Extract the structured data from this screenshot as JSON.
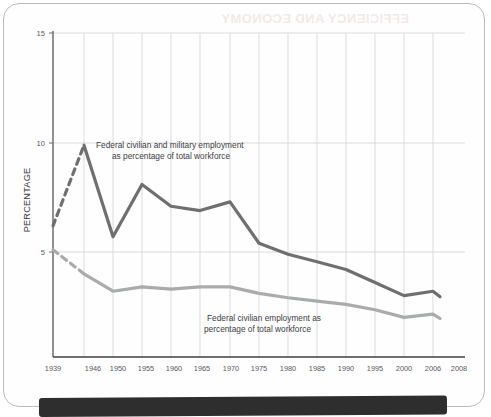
{
  "figure": {
    "background_color": "#ffffff",
    "card_border_color": "#b9bcbd",
    "caption_band_color": "#2e2e2e",
    "bleed_through_text": "EFFICIENCY AND ECONOMY"
  },
  "axes": {
    "y_axis_title": "PERCENTAGE",
    "y_tick_labels": [
      "15",
      "10",
      "5"
    ],
    "x_tick_labels": [
      "1939",
      "1946",
      "1950",
      "1955",
      "1960",
      "1965",
      "1970",
      "1975",
      "1980",
      "1985",
      "1990",
      "1995",
      "2000",
      "2006",
      "2008"
    ]
  },
  "annotations": {
    "total_series_line1": "Federal civilian and military employment",
    "total_series_line2": "as percentage of total workforce",
    "civilian_series_line1": "Federal civilian employment as",
    "civilian_series_line2": "percentage of total workforce"
  },
  "chart_data": {
    "type": "line",
    "title": "",
    "subtitle": "",
    "xlabel": "",
    "ylabel": "PERCENTAGE",
    "xlim": [
      1939,
      2008
    ],
    "ylim": [
      0,
      15
    ],
    "y_ticks": [
      5,
      10,
      15
    ],
    "grid": true,
    "grid_axis": "x",
    "legend": "annotations-inline",
    "x": [
      1939,
      1946,
      1950,
      1955,
      1960,
      1965,
      1970,
      1975,
      1980,
      1985,
      1990,
      1995,
      2000,
      2006,
      2008
    ],
    "series": [
      {
        "name": "Federal civilian and military employment as percentage of total workforce",
        "color": "#6e6f71",
        "line_width": 3.2,
        "values": [
          6.2,
          9.9,
          5.7,
          8.1,
          7.1,
          6.9,
          7.3,
          5.4,
          4.9,
          4.55,
          4.2,
          3.6,
          3.0,
          3.2,
          2.95
        ],
        "dashed_from": 1939,
        "dashed_to": 1946,
        "dash_note": "segment 1939-1946 drawn dashed (interpolated)"
      },
      {
        "name": "Federal civilian employment as percentage of total workforce",
        "color": "#a9abac",
        "line_width": 3.2,
        "values": [
          5.1,
          4.0,
          3.2,
          3.4,
          3.3,
          3.4,
          3.4,
          3.1,
          2.9,
          2.75,
          2.6,
          2.35,
          2.0,
          2.15,
          1.95
        ],
        "dashed_from": 1939,
        "dashed_to": 1946,
        "dash_note": "segment 1939-1946 drawn dashed (interpolated)"
      }
    ]
  },
  "geometry": {
    "plot_left_px": 53,
    "plot_right_px": 465,
    "plot_top_px": 33,
    "plot_bottom_px": 357,
    "y_for_15_px": 33,
    "y_for_10_px": 143,
    "y_for_5_px": 252,
    "x_positions_px": [
      53,
      84,
      113,
      142,
      171,
      200,
      230,
      259,
      288,
      317,
      346,
      375,
      404,
      433,
      440
    ]
  }
}
